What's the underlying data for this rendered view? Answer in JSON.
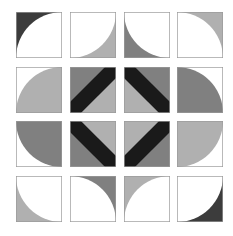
{
  "colors": {
    "white": "#ffffff",
    "light": "#b0b0b0",
    "mid": "#808080",
    "dark": "#3c3c3c",
    "black": "#1a1a1a",
    "border": "#9a9a9a"
  },
  "grid": {
    "rows": 4,
    "cols": 4,
    "col_x": [
      16,
      70,
      124,
      177
    ],
    "row_y": [
      12,
      67,
      121,
      176
    ],
    "tile_size": 46
  },
  "tiles": [
    {
      "r": 0,
      "c": 0,
      "type": "arc",
      "center": "br",
      "inside": "white",
      "outside": "dark"
    },
    {
      "r": 0,
      "c": 1,
      "type": "arc",
      "center": "tl",
      "inside": "white",
      "outside": "light"
    },
    {
      "r": 0,
      "c": 2,
      "type": "arc",
      "center": "tr",
      "inside": "white",
      "outside": "mid"
    },
    {
      "r": 0,
      "c": 3,
      "type": "arc",
      "center": "bl",
      "inside": "white",
      "outside": "light"
    },
    {
      "r": 1,
      "c": 0,
      "type": "arc",
      "center": "br",
      "inside": "light",
      "outside": "white"
    },
    {
      "r": 1,
      "c": 1,
      "type": "band",
      "dir": "bl-tr",
      "a": "mid",
      "b": "light"
    },
    {
      "r": 1,
      "c": 2,
      "type": "band",
      "dir": "tl-br",
      "a": "mid",
      "b": "light"
    },
    {
      "r": 1,
      "c": 3,
      "type": "arc",
      "center": "bl",
      "inside": "mid",
      "outside": "white"
    },
    {
      "r": 2,
      "c": 0,
      "type": "arc",
      "center": "tr",
      "inside": "mid",
      "outside": "white"
    },
    {
      "r": 2,
      "c": 1,
      "type": "band",
      "dir": "tl-br",
      "a": "light",
      "b": "mid"
    },
    {
      "r": 2,
      "c": 2,
      "type": "band",
      "dir": "bl-tr",
      "a": "light",
      "b": "mid"
    },
    {
      "r": 2,
      "c": 3,
      "type": "arc",
      "center": "tl",
      "inside": "light",
      "outside": "white"
    },
    {
      "r": 3,
      "c": 0,
      "type": "arc",
      "center": "tr",
      "inside": "white",
      "outside": "light"
    },
    {
      "r": 3,
      "c": 1,
      "type": "arc",
      "center": "bl",
      "inside": "white",
      "outside": "mid"
    },
    {
      "r": 3,
      "c": 2,
      "type": "arc",
      "center": "br",
      "inside": "white",
      "outside": "light"
    },
    {
      "r": 3,
      "c": 3,
      "type": "arc",
      "center": "tl",
      "inside": "white",
      "outside": "dark"
    }
  ]
}
